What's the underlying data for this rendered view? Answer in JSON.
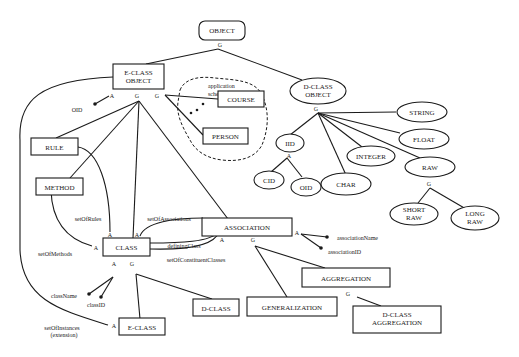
{
  "diagram": {
    "nodes": {
      "object": "OBJECT",
      "eclass_object_1": "E-CLASS",
      "eclass_object_2": "OBJECT",
      "dclass_object_1": "D-CLASS",
      "dclass_object_2": "OBJECT",
      "course": "COURSE",
      "person": "PERSON",
      "rule": "RULE",
      "method": "METHOD",
      "class": "CLASS",
      "association": "ASSOCIATION",
      "aggregation": "AGGREGATION",
      "generalization": "GENERALIZATION",
      "dclass_aggregation_1": "D-CLASS",
      "dclass_aggregation_2": "AGGREGATION",
      "dclass": "D-CLASS",
      "eclass": "E-CLASS",
      "string": "STRING",
      "float": "FLOAT",
      "integer": "INTEGER",
      "raw": "RAW",
      "iid": "IID",
      "char": "CHAR",
      "cid": "CID",
      "oid_ellipse": "OID",
      "short_raw_1": "SHORT",
      "short_raw_2": "RAW",
      "long_raw_1": "LONG",
      "long_raw_2": "RAW"
    },
    "labels": {
      "application_schema_1": "application",
      "application_schema_2": "schema",
      "oid_attr": "OID",
      "set_of_rules": "setOfRules",
      "set_of_methods": "setOfMethods",
      "set_of_associations": "setOfAssociations",
      "defining_class": "definingClass",
      "set_of_constituent_classes": "setOfConstituentClasses",
      "class_name": "className",
      "class_id": "classID",
      "set_of_instances_1": "setOfInstances",
      "set_of_instances_2": "(extension)",
      "association_name": "associationName",
      "association_id": "associationID",
      "ellipsis": "• • •"
    },
    "markers": {
      "generalization": "G",
      "attribute": "A"
    }
  }
}
